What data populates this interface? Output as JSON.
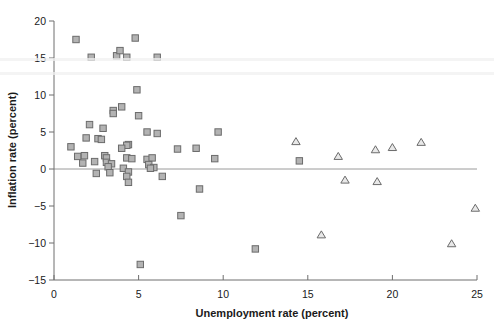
{
  "chart_data": {
    "type": "scatter",
    "title": "",
    "xlabel": "Unemployment rate (percent)",
    "ylabel": "Inflation rate (percent)",
    "xlim": [
      0,
      25
    ],
    "ylim": [
      -15,
      20
    ],
    "xticks": [
      0,
      5,
      10,
      15,
      20,
      25
    ],
    "yticks": [
      20,
      15,
      10,
      5,
      0,
      -5,
      -10,
      -15
    ],
    "xtick_labels": [
      "0",
      "5",
      "10",
      "15",
      "20",
      "25"
    ],
    "ytick_labels": [
      "20",
      "15",
      "10",
      "5",
      "0",
      "-5",
      "-10",
      "-15"
    ],
    "grid": false,
    "legend": "none",
    "reference_lines": [
      {
        "axis": "y",
        "value": 0,
        "color": "#9a9a9a"
      }
    ],
    "series": [
      {
        "name": "square-markers",
        "marker": "square",
        "fill_color": "#b3b3b3",
        "edge_color": "#6b6b6b",
        "points": [
          [
            1.3,
            17.5
          ],
          [
            2.2,
            15.1
          ],
          [
            3.7,
            15.3
          ],
          [
            3.9,
            16.0
          ],
          [
            4.3,
            15.1
          ],
          [
            4.8,
            17.7
          ],
          [
            6.1,
            15.1
          ],
          [
            4.9,
            10.7
          ],
          [
            4.0,
            8.4
          ],
          [
            3.5,
            7.9
          ],
          [
            3.5,
            7.5
          ],
          [
            5.0,
            7.2
          ],
          [
            2.1,
            6.0
          ],
          [
            2.9,
            5.5
          ],
          [
            5.5,
            5.0
          ],
          [
            6.1,
            4.8
          ],
          [
            9.7,
            5.0
          ],
          [
            1.9,
            4.2
          ],
          [
            2.6,
            4.1
          ],
          [
            2.8,
            4.0
          ],
          [
            4.4,
            3.3
          ],
          [
            4.3,
            3.2
          ],
          [
            1.0,
            3.0
          ],
          [
            4.0,
            2.8
          ],
          [
            8.4,
            2.8
          ],
          [
            7.3,
            2.7
          ],
          [
            1.4,
            1.7
          ],
          [
            1.8,
            1.8
          ],
          [
            3.0,
            1.8
          ],
          [
            3.1,
            1.5
          ],
          [
            4.3,
            1.5
          ],
          [
            4.6,
            1.4
          ],
          [
            5.5,
            1.3
          ],
          [
            5.8,
            1.5
          ],
          [
            9.5,
            1.4
          ],
          [
            14.5,
            1.1
          ],
          [
            1.7,
            0.8
          ],
          [
            2.4,
            1.0
          ],
          [
            3.1,
            0.9
          ],
          [
            3.4,
            0.7
          ],
          [
            3.2,
            0.3
          ],
          [
            4.1,
            0.1
          ],
          [
            5.6,
            0.6
          ],
          [
            5.9,
            0.2
          ],
          [
            5.7,
            0.1
          ],
          [
            2.5,
            -0.6
          ],
          [
            3.3,
            -0.5
          ],
          [
            4.4,
            -0.4
          ],
          [
            4.3,
            -1.0
          ],
          [
            4.4,
            -1.8
          ],
          [
            6.4,
            -1.0
          ],
          [
            8.6,
            -2.7
          ],
          [
            7.5,
            -6.3
          ],
          [
            11.9,
            -10.8
          ],
          [
            5.1,
            -12.9
          ]
        ]
      },
      {
        "name": "triangle-markers",
        "marker": "triangle",
        "fill_color": "#e8e8e8",
        "edge_color": "#6b6b6b",
        "points": [
          [
            14.3,
            3.7
          ],
          [
            16.8,
            1.7
          ],
          [
            19.0,
            2.6
          ],
          [
            20.0,
            2.9
          ],
          [
            21.7,
            3.6
          ],
          [
            17.2,
            -1.5
          ],
          [
            19.1,
            -1.7
          ],
          [
            24.9,
            -5.3
          ],
          [
            15.8,
            -8.9
          ],
          [
            23.5,
            -10.1
          ]
        ]
      }
    ]
  }
}
